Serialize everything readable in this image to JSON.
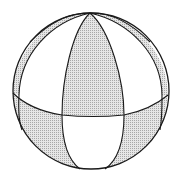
{
  "diagram": {
    "title": "Sphere divided into octants by equator and meridians",
    "colors": {
      "background": "#ffffff",
      "stroke": "#1a1a1a",
      "shade": "#cfcfcf"
    },
    "elements": [
      {
        "name": "outer-circle",
        "kind": "circle"
      },
      {
        "name": "equator",
        "kind": "ellipse"
      },
      {
        "name": "front-meridian-left",
        "kind": "arc"
      },
      {
        "name": "front-meridian-right",
        "kind": "arc"
      },
      {
        "name": "back-meridian-left",
        "kind": "arc"
      },
      {
        "name": "back-meridian-right",
        "kind": "arc"
      }
    ],
    "shaded_regions": [
      "upper-front-center",
      "lower-front-left",
      "lower-front-right",
      "upper-left-rim",
      "upper-right-rim"
    ]
  }
}
